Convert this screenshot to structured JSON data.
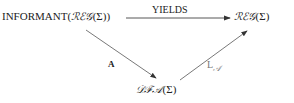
{
  "diagram": {
    "nodes": {
      "informant": {
        "prefix": "INFORMANT(",
        "cal": "ℛℰ𝒢",
        "suffix": "(Σ))"
      },
      "reg": {
        "cal": "ℛℰ𝒢",
        "suffix": "(Σ)"
      },
      "dfa": {
        "cal": "𝒟ℱ𝒜",
        "suffix": "(Σ)"
      }
    },
    "edges": {
      "yields": {
        "label": "YIELDS",
        "from": "informant",
        "to": "reg"
      },
      "a": {
        "label": "A",
        "from": "informant",
        "to": "dfa"
      },
      "la": {
        "label_main": "L",
        "label_sub": "𝒜",
        "from": "dfa",
        "to": "reg"
      }
    }
  }
}
